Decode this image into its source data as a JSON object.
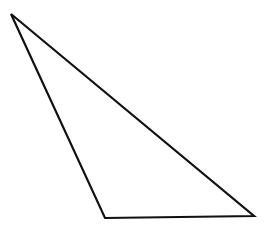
{
  "diagram": {
    "shape": "triangle",
    "type": "obtuse-scalene",
    "background_color": "#ffffff",
    "stroke_color": "#111111",
    "fill_color": "#ffffff",
    "stroke_width": 2.2,
    "vertices": [
      {
        "id": "A",
        "x": 11,
        "y": 14
      },
      {
        "id": "B",
        "x": 105,
        "y": 218
      },
      {
        "id": "C",
        "x": 254,
        "y": 216
      }
    ]
  }
}
